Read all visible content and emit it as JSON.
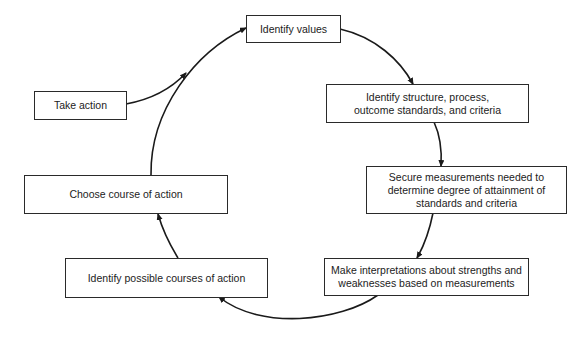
{
  "diagram": {
    "type": "cycle-flowchart",
    "nodes": [
      {
        "id": "identify-values",
        "label": "Identify values"
      },
      {
        "id": "identify-standards",
        "label": "Identify structure, process,\noutcome standards, and criteria"
      },
      {
        "id": "secure-measurements",
        "label": "Secure measurements needed to\ndetermine degree of attainment of\nstandards and criteria"
      },
      {
        "id": "make-interpretations",
        "label": "Make interpretations about strengths and\nweaknesses based on measurements"
      },
      {
        "id": "identify-courses",
        "label": "Identify possible courses of action"
      },
      {
        "id": "choose-course",
        "label": "Choose course of action"
      },
      {
        "id": "take-action",
        "label": "Take action"
      }
    ],
    "edges": [
      {
        "from": "identify-values",
        "to": "identify-standards"
      },
      {
        "from": "identify-standards",
        "to": "secure-measurements"
      },
      {
        "from": "secure-measurements",
        "to": "make-interpretations"
      },
      {
        "from": "make-interpretations",
        "to": "identify-courses"
      },
      {
        "from": "identify-courses",
        "to": "choose-course"
      },
      {
        "from": "choose-course",
        "to": "identify-values"
      },
      {
        "from": "take-action",
        "to": "identify-values"
      }
    ],
    "colors": {
      "line": "#1a1a1a",
      "box_border": "#2a2a2a",
      "text": "#222222",
      "background": "#ffffff"
    }
  }
}
